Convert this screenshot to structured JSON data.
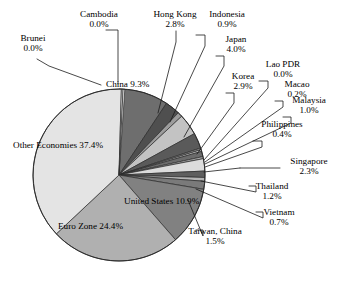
{
  "chart_data": {
    "type": "pie",
    "title": "",
    "subtitle": "",
    "xlabel": "",
    "ylabel": "",
    "legend_position": "none",
    "grid": false,
    "unit": "%",
    "categories": [
      "China",
      "Hong Kong",
      "Indonesia",
      "Japan",
      "Korea",
      "Lao PDR",
      "Macao",
      "Malaysia",
      "Philippines",
      "Singapore",
      "Thailand",
      "Vietnam",
      "Taiwan, China",
      "United States",
      "Euro Zone",
      "Other Economies",
      "Brunei",
      "Cambodia"
    ],
    "values": [
      9.3,
      2.8,
      0.9,
      4.0,
      2.9,
      0.0,
      0.2,
      1.0,
      0.4,
      2.3,
      1.2,
      0.7,
      1.5,
      10.9,
      24.4,
      37.4,
      0.0,
      0.0
    ],
    "slices": [
      {
        "name": "China",
        "value": 9.3,
        "value_label": "9.3%",
        "color": "#6e6e6e",
        "label_placement": "inside"
      },
      {
        "name": "Hong Kong",
        "value": 2.8,
        "value_label": "2.8%",
        "color": "#4f4f4f",
        "label_placement": "outside"
      },
      {
        "name": "Indonesia",
        "value": 0.9,
        "value_label": "0.9%",
        "color": "#9c9c9c",
        "label_placement": "outside"
      },
      {
        "name": "Japan",
        "value": 4.0,
        "value_label": "4.0%",
        "color": "#c3c3c3",
        "label_placement": "outside"
      },
      {
        "name": "Korea",
        "value": 2.9,
        "value_label": "2.9%",
        "color": "#5a5a5a",
        "label_placement": "outside"
      },
      {
        "name": "Lao PDR",
        "value": 0.0,
        "value_label": "0.0%",
        "color": "#8a8a8a",
        "label_placement": "outside"
      },
      {
        "name": "Macao",
        "value": 0.2,
        "value_label": "0.2%",
        "color": "#d2d2d2",
        "label_placement": "outside"
      },
      {
        "name": "Malaysia",
        "value": 1.0,
        "value_label": "1.0%",
        "color": "#6b6b6b",
        "label_placement": "outside"
      },
      {
        "name": "Philippines",
        "value": 0.4,
        "value_label": "0.4%",
        "color": "#a8a8a8",
        "label_placement": "outside"
      },
      {
        "name": "Singapore",
        "value": 2.3,
        "value_label": "2.3%",
        "color": "#dcdcdc",
        "label_placement": "outside"
      },
      {
        "name": "Thailand",
        "value": 1.2,
        "value_label": "1.2%",
        "color": "#5f5f5f",
        "label_placement": "outside"
      },
      {
        "name": "Vietnam",
        "value": 0.7,
        "value_label": "0.7%",
        "color": "#b5b5b5",
        "label_placement": "outside"
      },
      {
        "name": "Taiwan, China",
        "value": 1.5,
        "value_label": "1.5%",
        "color": "#7a7a7a",
        "label_placement": "outside"
      },
      {
        "name": "United States",
        "value": 10.9,
        "value_label": "10.9%",
        "color": "#818181",
        "label_placement": "inside"
      },
      {
        "name": "Euro Zone",
        "value": 24.4,
        "value_label": "24.4%",
        "color": "#b0b0b0",
        "label_placement": "inside"
      },
      {
        "name": "Other Economies",
        "value": 37.4,
        "value_label": "37.4%",
        "color": "#e4e4e4",
        "label_placement": "inside"
      },
      {
        "name": "Brunei",
        "value": 0.0,
        "value_label": "0.0%",
        "color": "#f0f0f0",
        "label_placement": "outside"
      },
      {
        "name": "Cambodia",
        "value": 0.0,
        "value_label": "0.0%",
        "color": "#fafafa",
        "label_placement": "outside"
      }
    ]
  },
  "labels": {
    "brunei": {
      "name": "Brunei",
      "value": "0.0%"
    },
    "cambodia": {
      "name": "Cambodia",
      "value": "0.0%"
    },
    "hong_kong": {
      "name": "Hong Kong",
      "value": "2.8%"
    },
    "indonesia": {
      "name": "Indonesia",
      "value": "0.9%"
    },
    "japan": {
      "name": "Japan",
      "value": "4.0%"
    },
    "korea": {
      "name": "Korea",
      "value": "2.9%"
    },
    "lao_pdr": {
      "name": "Lao PDR",
      "value": "0.0%"
    },
    "macao": {
      "name": "Macao",
      "value": "0.2%"
    },
    "malaysia": {
      "name": "Malaysia",
      "value": "1.0%"
    },
    "philippines": {
      "name": "Philippines",
      "value": "0.4%"
    },
    "singapore": {
      "name": "Singapore",
      "value": "2.3%"
    },
    "thailand": {
      "name": "Thailand",
      "value": "1.2%"
    },
    "vietnam": {
      "name": "Vietnam",
      "value": "0.7%"
    },
    "taiwan_china": {
      "name": "Taiwan, China",
      "value": "1.5%"
    },
    "china": {
      "name": "China",
      "value": "9.3%"
    },
    "united_states": {
      "name": "United States",
      "value": "10.9%"
    },
    "euro_zone": {
      "name": "Euro Zone",
      "value": "24.4%"
    },
    "other_economies": {
      "name": "Other Economies",
      "value": "37.4%"
    }
  }
}
